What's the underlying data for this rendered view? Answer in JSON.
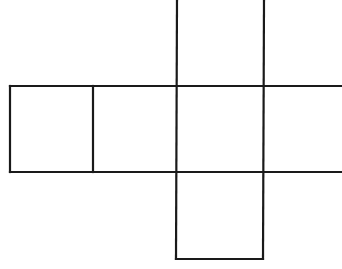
{
  "diagram": {
    "type": "cube-net",
    "canvas": {
      "width": 342,
      "height": 269
    },
    "stroke_color": "#1a1a1a",
    "background_color": "#ffffff",
    "cell_size": 86,
    "faces": [
      {
        "id": "left",
        "x": 10,
        "y": 86,
        "w": 83,
        "h": 86,
        "open_sides": []
      },
      {
        "id": "center-left",
        "x": 93,
        "y": 86,
        "w": 84,
        "h": 86,
        "open_sides": []
      },
      {
        "id": "center",
        "x": 177,
        "y": 86,
        "w": 87,
        "h": 86,
        "open_sides": []
      },
      {
        "id": "right",
        "x": 264,
        "y": 86,
        "w": 78,
        "h": 86,
        "open_sides": [
          "right"
        ]
      },
      {
        "id": "top",
        "x": 177,
        "y": 0,
        "w": 87,
        "h": 86,
        "open_sides": [
          "top"
        ]
      },
      {
        "id": "bottom",
        "x": 177,
        "y": 172,
        "w": 87,
        "h": 87,
        "open_sides": []
      }
    ],
    "labels": []
  }
}
